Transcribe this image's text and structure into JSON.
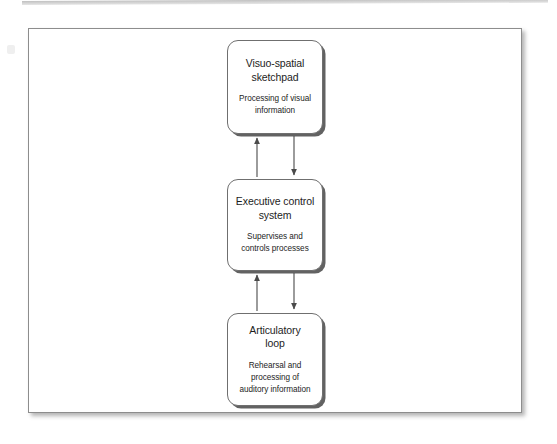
{
  "figure": {
    "type": "flow-diagram",
    "orientation": "vertical",
    "background_color": "#ffffff",
    "frame_border_color": "#8d8d8d",
    "node_border_color": "#6f6f6f",
    "arrow_color": "#4a4a4a",
    "text_color": "#1d1d1d",
    "nodes": [
      {
        "id": "visuo-spatial-sketchpad",
        "title": "Visuo-spatial\nsketchpad",
        "description": "Processing of visual\ninformation"
      },
      {
        "id": "executive-control-system",
        "title": "Executive control\nsystem",
        "description": "Supervises and\ncontrols processes"
      },
      {
        "id": "articulatory-loop",
        "title": "Articulatory\nloop",
        "description": "Rehearsal and\nprocessing of\nauditory information"
      }
    ],
    "connectors": [
      {
        "id": "sketchpad-to-executive",
        "from": "visuo-spatial-sketchpad",
        "to": "executive-control-system",
        "direction": "down",
        "side": "right"
      },
      {
        "id": "executive-to-sketchpad",
        "from": "executive-control-system",
        "to": "visuo-spatial-sketchpad",
        "direction": "up",
        "side": "left"
      },
      {
        "id": "executive-to-articulatory",
        "from": "executive-control-system",
        "to": "articulatory-loop",
        "direction": "down",
        "side": "right"
      },
      {
        "id": "articulatory-to-executive",
        "from": "articulatory-loop",
        "to": "executive-control-system",
        "direction": "up",
        "side": "left"
      }
    ]
  }
}
